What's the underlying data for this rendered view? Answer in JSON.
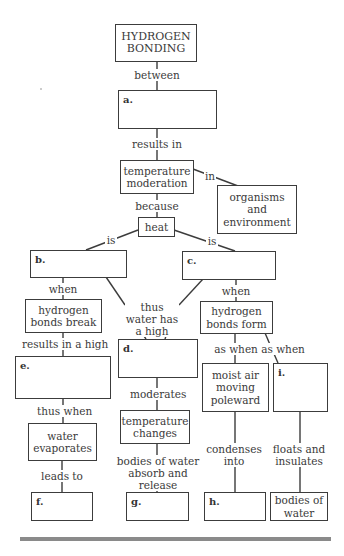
{
  "diagram": {
    "type": "concept-map",
    "nodes": {
      "hydrogen_bonding": "HYDROGEN BONDING",
      "a": "a.",
      "temperature_moderation": "temperature moderation",
      "organisms_environment": "organisms and environment",
      "heat": "heat",
      "b": "b.",
      "c": "c.",
      "bonds_break": "hydrogen bonds break",
      "bonds_form": "hydrogen bonds form",
      "d": "d.",
      "e": "e.",
      "moist_air": "moist air moving poleward",
      "i": "i.",
      "water_evaporates": "water evaporates",
      "temperature_changes": "temperature changes",
      "f": "f.",
      "g": "g.",
      "h": "h.",
      "bodies_of_water": "bodies of water"
    },
    "links": {
      "between": "between",
      "results_in": "results in",
      "in": "in",
      "because": "because",
      "is_left": "is",
      "is_right": "is",
      "when_left": "when",
      "when_right": "when",
      "thus_water_has_a_high": "thus water has a high",
      "results_in_a_high": "results in a high",
      "as_when_1": "as when",
      "as_when_2": "as when",
      "moderates": "moderates",
      "thus_when": "thus when",
      "leads_to": "leads to",
      "bodies_absorb_release": "bodies of water absorb and release",
      "condenses_into": "condenses into",
      "floats_and_insulates": "floats and insulates"
    }
  }
}
